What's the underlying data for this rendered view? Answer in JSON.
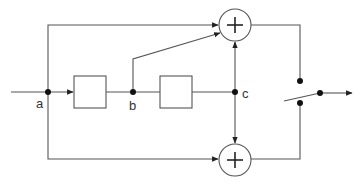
{
  "diagram": {
    "type": "signal-flow block diagram",
    "colors": {
      "wire": "#555555",
      "node": "#111111",
      "background": "#ffffff"
    },
    "labels": {
      "a": "a",
      "b": "b",
      "c": "c"
    },
    "nodes": [
      {
        "id": "a",
        "x": 48,
        "y": 92
      },
      {
        "id": "b",
        "x": 133,
        "y": 92
      },
      {
        "id": "c",
        "x": 235,
        "y": 92
      }
    ],
    "blocks": [
      {
        "id": "block-1",
        "x": 74,
        "y": 76,
        "w": 32,
        "h": 32
      },
      {
        "id": "block-2",
        "x": 160,
        "y": 76,
        "w": 32,
        "h": 32
      }
    ],
    "adders": [
      {
        "id": "adder-top",
        "symbol": "+",
        "cx": 235,
        "cy": 25,
        "r": 16
      },
      {
        "id": "adder-bottom",
        "symbol": "+",
        "cx": 235,
        "cy": 160,
        "r": 16
      }
    ],
    "switch": {
      "pivot": [
        320,
        93
      ],
      "contact_top": [
        300,
        81
      ],
      "contact_bottom": [
        300,
        103
      ],
      "output_to": [
        352,
        93
      ]
    }
  }
}
